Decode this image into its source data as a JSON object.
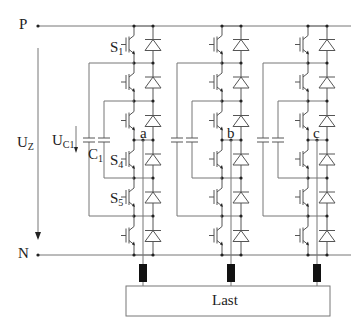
{
  "diagram": {
    "type": "three-phase flying-capacitor multilevel inverter",
    "colors": {
      "wire": "#777777",
      "component": "#555555",
      "text": "#222222",
      "inductor": "#111111"
    },
    "rails": {
      "positive": "P",
      "negative": "N"
    },
    "voltages": {
      "dc_link": {
        "main": "U",
        "sub": "Z"
      },
      "capacitor": {
        "main": "U",
        "sub": "C1"
      }
    },
    "capacitor": {
      "main": "C",
      "sub": "1"
    },
    "switches": [
      {
        "main": "S",
        "sub": "1"
      },
      {
        "main": "S",
        "sub": "4"
      },
      {
        "main": "S",
        "sub": "5"
      }
    ],
    "phases": [
      "a",
      "b",
      "c"
    ],
    "load_label": "Last"
  }
}
